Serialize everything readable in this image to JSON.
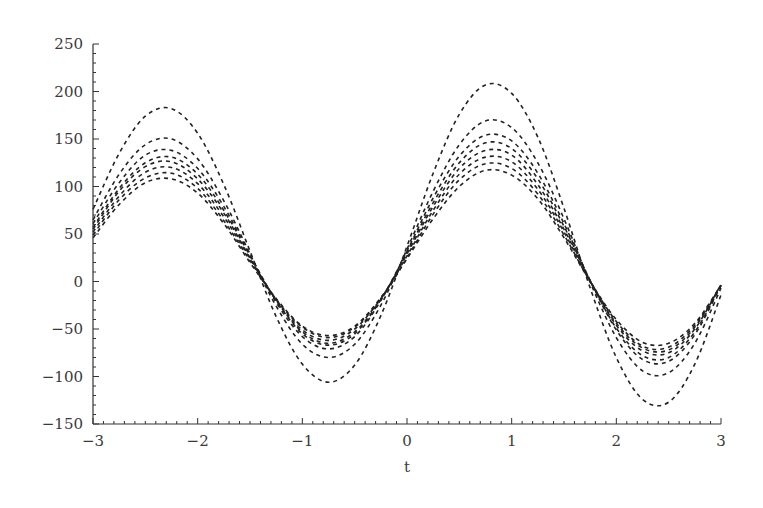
{
  "chart_data": {
    "type": "line",
    "title": "",
    "xlabel": "t",
    "ylabel": "",
    "xlim": [
      -3,
      3
    ],
    "ylim": [
      -150,
      250
    ],
    "grid": false,
    "legend": null,
    "line_style": "dashed",
    "line_color": "#222222",
    "x_ticks": [
      -3,
      -2,
      -1,
      0,
      1,
      2,
      3
    ],
    "x_tick_labels": [
      "−3",
      "−2",
      "−1",
      "0",
      "1",
      "2",
      "3"
    ],
    "y_ticks": [
      -150,
      -100,
      -50,
      0,
      50,
      100,
      150,
      200,
      250
    ],
    "y_tick_labels": [
      "−150",
      "−100",
      "−50",
      "0",
      "50",
      "100",
      "150",
      "200",
      "250"
    ],
    "x": [
      -3,
      -2.75,
      -2.5,
      -2.25,
      -2,
      -1.75,
      -1.5,
      -1.25,
      -1,
      -0.75,
      -0.5,
      -0.25,
      0,
      0.25,
      0.5,
      0.75,
      1,
      1.25,
      1.5,
      1.75,
      2,
      2.25,
      2.5,
      2.75,
      3
    ],
    "series": [
      {
        "name": "curve-1",
        "values": [
          76,
          135,
          174,
          182,
          156,
          102,
          32,
          -37,
          -87,
          -106,
          -88,
          -36,
          37,
          114,
          176,
          207,
          198,
          152,
          77,
          -7,
          -80,
          -124,
          -127,
          -87,
          -14
        ]
      },
      {
        "name": "curve-2",
        "values": [
          65,
          113,
          144,
          150,
          129,
          85,
          29,
          -26,
          -66,
          -80,
          -66,
          -25,
          34,
          95,
          144,
          169,
          162,
          125,
          66,
          -1,
          -59,
          -94,
          -96,
          -65,
          -7
        ]
      },
      {
        "name": "curve-3",
        "values": [
          61,
          104,
          133,
          138,
          119,
          79,
          28,
          -22,
          -58,
          -71,
          -58,
          -20,
          32,
          88,
          132,
          154,
          148,
          114,
          61,
          1,
          -51,
          -82,
          -84,
          -56,
          -4
        ]
      },
      {
        "name": "curve-4",
        "values": [
          57,
          98,
          125,
          131,
          113,
          75,
          27,
          -20,
          -55,
          -67,
          -55,
          -19,
          31,
          83,
          125,
          146,
          140,
          108,
          58,
          1,
          -49,
          -78,
          -80,
          -53,
          -4
        ]
      },
      {
        "name": "curve-5",
        "values": [
          55,
          95,
          121,
          126,
          108,
          72,
          25,
          -20,
          -53,
          -65,
          -53,
          -19,
          29,
          79,
          119,
          138,
          133,
          102,
          55,
          1,
          -46,
          -73,
          -75,
          -50,
          -3
        ]
      },
      {
        "name": "curve-6",
        "values": [
          52,
          90,
          115,
          120,
          103,
          68,
          24,
          -19,
          -51,
          -62,
          -50,
          -18,
          27,
          75,
          113,
          131,
          126,
          97,
          52,
          0,
          -44,
          -70,
          -72,
          -48,
          -4
        ]
      },
      {
        "name": "curve-7",
        "values": [
          49,
          86,
          109,
          114,
          98,
          64,
          22,
          -19,
          -48,
          -59,
          -48,
          -18,
          25,
          71,
          107,
          124,
          119,
          92,
          49,
          0,
          -42,
          -68,
          -69,
          -46,
          -4
        ]
      },
      {
        "name": "curve-8",
        "values": [
          46,
          81,
          104,
          108,
          93,
          61,
          20,
          -18,
          -47,
          -57,
          -47,
          -17,
          24,
          66,
          100,
          117,
          112,
          87,
          46,
          0,
          -40,
          -64,
          -65,
          -44,
          -4
        ]
      }
    ]
  }
}
